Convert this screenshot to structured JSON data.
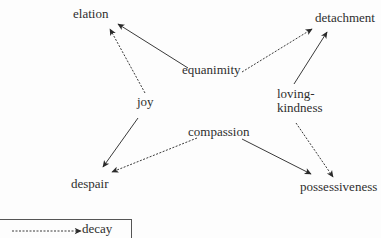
{
  "diagram": {
    "nodes": {
      "elation": "elation",
      "detachment": "detachment",
      "equanimity": "equanimity",
      "joy": "joy",
      "loving_kindness_line1": "loving-",
      "loving_kindness_line2": "kindness",
      "compassion": "compassion",
      "despair": "despair",
      "possessiveness": "possessiveness"
    },
    "edges": [
      {
        "from": "equanimity",
        "to": "elation",
        "style": "solid"
      },
      {
        "from": "joy",
        "to": "elation",
        "style": "dashed"
      },
      {
        "from": "equanimity",
        "to": "detachment",
        "style": "dashed"
      },
      {
        "from": "loving-kindness",
        "to": "detachment",
        "style": "solid"
      },
      {
        "from": "joy",
        "to": "despair",
        "style": "solid"
      },
      {
        "from": "compassion",
        "to": "despair",
        "style": "dashed"
      },
      {
        "from": "compassion",
        "to": "possessiveness",
        "style": "solid"
      },
      {
        "from": "loving-kindness",
        "to": "possessiveness",
        "style": "dashed"
      }
    ],
    "legend": {
      "dashed_label": "decay"
    },
    "colors": {
      "line": "#3a3a3a",
      "text": "#2e2e2e",
      "background": "#fdfdfd"
    }
  }
}
